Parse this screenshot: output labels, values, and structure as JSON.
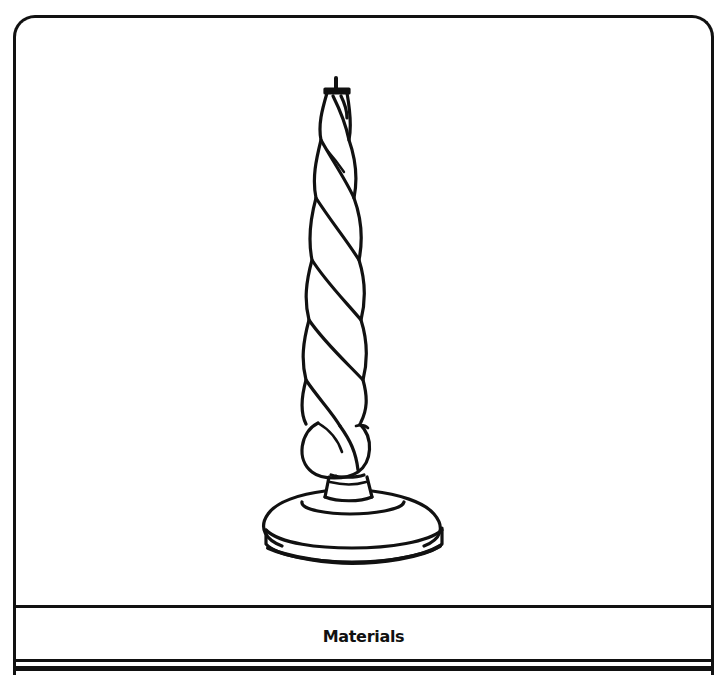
{
  "figure": {
    "caption": "Materials"
  },
  "colors": {
    "ink": "#111111",
    "paper": "#ffffff"
  }
}
